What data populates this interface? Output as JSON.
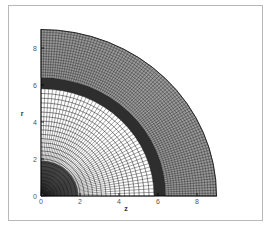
{
  "chart_data": {
    "type": "mesh",
    "title": "",
    "xlabel": "z",
    "ylabel": "r",
    "xlim": [
      0,
      9
    ],
    "ylim": [
      0,
      9
    ],
    "xticks": [
      "0",
      "2",
      "4",
      "6",
      "8"
    ],
    "yticks": [
      "0",
      "2",
      "4",
      "6",
      "8"
    ],
    "grid": false,
    "legend": null,
    "mesh": {
      "shape": "quarter-circle polar grid",
      "outer_radius": 9,
      "dense_band": {
        "r_inner": 5.8,
        "r_outer": 6.4
      },
      "outer_region": {
        "r_inner": 6.4,
        "r_outer": 9
      },
      "inner_region": {
        "r_inner": 0,
        "r_outer": 5.8
      },
      "dense_core_radius": 1.2
    }
  },
  "colors": {
    "mesh_line": "#1a1a1a",
    "frame": "#b8b8b8",
    "background": "#ffffff"
  }
}
